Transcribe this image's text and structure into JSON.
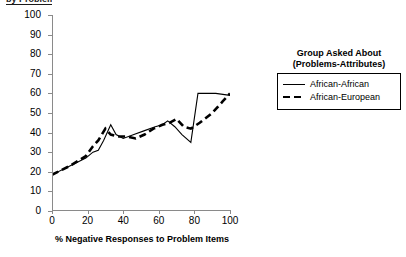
{
  "top_fragment": {
    "text": "by Problems"
  },
  "chart_data": {
    "type": "line",
    "title": "",
    "xlabel": "% Negative Responses to Problem Items",
    "ylabel": "",
    "xlim": [
      0,
      100
    ],
    "ylim": [
      0,
      100
    ],
    "xticks": [
      0,
      20,
      40,
      60,
      80,
      100
    ],
    "yticks": [
      0,
      10,
      20,
      30,
      40,
      50,
      60,
      70,
      80,
      90,
      100
    ],
    "grid": false,
    "legend_position": "right",
    "legend_title_line1": "Group Asked About",
    "legend_title_line2": "(Problems-Attributes)",
    "series": [
      {
        "name": "African-African",
        "style": "solid",
        "color": "#000000",
        "points": [
          [
            0,
            18.5
          ],
          [
            10,
            23
          ],
          [
            19,
            27
          ],
          [
            23,
            30
          ],
          [
            26,
            31
          ],
          [
            29,
            36
          ],
          [
            33,
            44
          ],
          [
            36,
            39
          ],
          [
            40,
            37
          ],
          [
            46,
            39
          ],
          [
            52,
            41
          ],
          [
            58,
            43
          ],
          [
            62,
            44
          ],
          [
            65,
            46
          ],
          [
            69,
            43
          ],
          [
            73,
            39
          ],
          [
            78,
            35
          ],
          [
            82,
            60
          ],
          [
            92,
            60
          ],
          [
            100,
            59
          ]
        ]
      },
      {
        "name": "African-European",
        "style": "dashed",
        "color": "#000000",
        "points": [
          [
            0,
            18.5
          ],
          [
            10,
            23
          ],
          [
            19,
            28
          ],
          [
            23,
            33
          ],
          [
            26,
            36
          ],
          [
            30,
            42
          ],
          [
            33,
            39
          ],
          [
            37,
            38
          ],
          [
            42,
            38
          ],
          [
            47,
            37
          ],
          [
            52,
            39
          ],
          [
            57,
            42
          ],
          [
            62,
            44
          ],
          [
            66,
            45
          ],
          [
            70,
            47
          ],
          [
            74,
            43
          ],
          [
            78,
            42
          ],
          [
            83,
            45
          ],
          [
            90,
            50
          ],
          [
            96,
            56
          ],
          [
            100,
            60
          ]
        ]
      }
    ]
  }
}
